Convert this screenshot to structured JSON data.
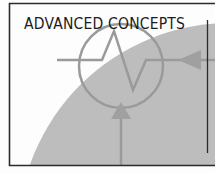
{
  "cover": {
    "title": "ADVANCED CONCEPTS",
    "icon": "schematic-source-symbol-icon"
  },
  "colors": {
    "background": "#fdfdfd",
    "border": "#2b2b2b",
    "gray_region": "#bdbdbd",
    "symbol_stroke": "#999999",
    "title_text": "#1c1c1c"
  }
}
